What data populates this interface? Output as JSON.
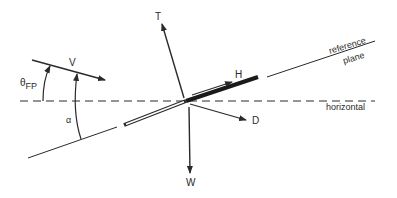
{
  "diagram": {
    "labels": {
      "thrust": "T",
      "weight": "W",
      "velocity": "V",
      "lift_h": "H",
      "drag": "D",
      "theta": "θ",
      "theta_sub": "FP",
      "alpha": "α",
      "reference_plane_line1": "reference",
      "reference_plane_line2": "plane",
      "horizontal": "horizontal"
    },
    "colors": {
      "ink": "#2a2a2a",
      "background": "#ffffff"
    }
  }
}
